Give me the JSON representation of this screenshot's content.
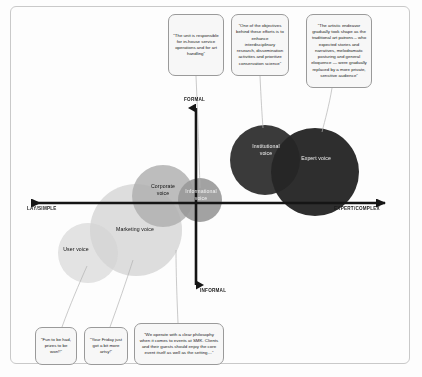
{
  "diagram": {
    "axes": {
      "vertical_top": "FORMAL",
      "vertical_bottom": "INFORMAL",
      "horizontal_left": "LAY/SIMPLE",
      "horizontal_right": "EXPERT/COMPLEX"
    },
    "bubbles": [
      {
        "id": "user-voice",
        "label": "User voice",
        "cx": 88,
        "cy": 253,
        "r": 30,
        "fill": "#d9d9d9",
        "text": "dark",
        "lx": 64,
        "ly": 250
      },
      {
        "id": "marketing-voice",
        "label": "Marketing voice",
        "cx": 136,
        "cy": 230,
        "r": 46,
        "fill": "#cfcfcf",
        "text": "dark",
        "lx": 108,
        "ly": 232
      },
      {
        "id": "corporate-voice",
        "label": "Corporate\nvoice",
        "cx": 163,
        "cy": 196,
        "r": 31,
        "fill": "#a8a8a8",
        "text": "dark",
        "lx": 144,
        "ly": 188
      },
      {
        "id": "informational-voice",
        "label": "Informational\nvoice",
        "cx": 200,
        "cy": 200,
        "r": 22,
        "fill": "#8f8f8f",
        "text": "light",
        "lx": 182,
        "ly": 193
      },
      {
        "id": "institutional-voice",
        "label": "Institutional\nvoice",
        "cx": 265,
        "cy": 160,
        "r": 35,
        "fill": "#1c1c1c",
        "text": "light",
        "lx": 246,
        "ly": 148
      },
      {
        "id": "expert-voice",
        "label": "Expert voice",
        "cx": 315,
        "cy": 172,
        "r": 44,
        "fill": "#0e0e0e",
        "text": "light",
        "lx": 295,
        "ly": 158
      }
    ],
    "callouts": [
      {
        "id": "in-house-service",
        "text": "“The unit is responsible for in-house service operations and for art handling”",
        "x": 168,
        "y": 14,
        "w": 56,
        "h": 62,
        "leader": [
          [
            196,
            76
          ],
          [
            200,
            188
          ]
        ]
      },
      {
        "id": "interdisciplinary-research",
        "text": "“One of the objectives behind these efforts is to enhance interdisciplinary research, dissemination activities and prioritize conservation science”",
        "x": 231,
        "y": 14,
        "w": 58,
        "h": 62,
        "leader": [
          [
            260,
            76
          ],
          [
            262,
            130
          ]
        ]
      },
      {
        "id": "artistic-endeavor",
        "text": "“The artistic endeavor gradually took shape as the traditional art patrons – who expected stories and narratives, melodramatic posturing and general eloquence — were gradually replaced by a more private, sensitive audience”",
        "x": 306,
        "y": 14,
        "w": 66,
        "h": 74,
        "leader": [
          [
            330,
            88
          ],
          [
            322,
            134
          ]
        ]
      },
      {
        "id": "fun-prizes",
        "text": "“Fun to be had, prizes to be won!!”",
        "x": 35,
        "y": 327,
        "w": 42,
        "h": 38,
        "leader": [
          [
            62,
            327
          ],
          [
            86,
            268
          ]
        ]
      },
      {
        "id": "friday-artsy",
        "text": "“Your Friday just got a bit more artsy!”",
        "x": 84,
        "y": 327,
        "w": 44,
        "h": 38,
        "leader": [
          [
            110,
            327
          ],
          [
            132,
            262
          ]
        ]
      },
      {
        "id": "smk-events-philosophy",
        "text": "“We operate with a clear philosophy when it comes to events at SMK. Clients and their guests should enjoy the core event itself as well as the setting…”",
        "x": 134,
        "y": 323,
        "w": 90,
        "h": 42,
        "leader": [
          [
            178,
            323
          ],
          [
            176,
            250
          ]
        ]
      }
    ],
    "colors": {
      "frame_border": "#c9c9c9",
      "axis": "#151515",
      "callout_border": "#9a9a9a",
      "callout_fill": "#f7f7f7",
      "leader_line": "#b0b0b0",
      "background": "#fdfdfd"
    }
  }
}
